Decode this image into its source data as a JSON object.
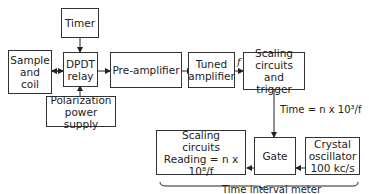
{
  "diagram": {
    "blocks": {
      "timer": "Timer",
      "sample_coil": [
        "Sample",
        "and",
        "coil"
      ],
      "dpdt_relay": [
        "DPDT",
        "relay"
      ],
      "polarization": [
        "Polarization",
        "power supply"
      ],
      "preamp": "Pre-amplifier",
      "tuned_amp": [
        "Tuned",
        "amplifier"
      ],
      "scaling_trigger": [
        "Scaling",
        "circuits and",
        "trigger"
      ],
      "gate": "Gate",
      "crystal": [
        "Crystal",
        "oscillator",
        "100 kc/s"
      ],
      "scaling_reading": [
        "Scaling",
        "circuits",
        "Reading = n x 10⁸/f"
      ]
    },
    "labels": {
      "f_signal": "f",
      "time_eq": "Time = n x 10³/f",
      "group": "Time interval meter"
    }
  }
}
